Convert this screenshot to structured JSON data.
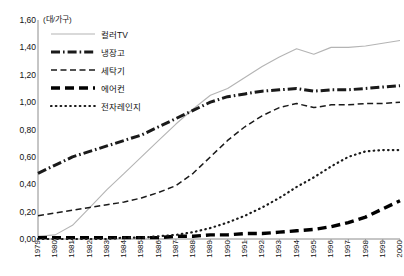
{
  "chart_data": {
    "type": "line",
    "title": "",
    "subtitle": "",
    "xlabel": "",
    "ylabel": "(대/가구)",
    "unit_caption": "(대/가구)",
    "grid": false,
    "legend_position": "top-left-inside",
    "ylim": [
      0.0,
      1.6
    ],
    "ytick_step": 0.2,
    "decimal_separator": ",",
    "ytick_labels": [
      "1,60",
      "1,40",
      "1,20",
      "1,00",
      "0,80",
      "0,60",
      "0,40",
      "0,20",
      "0,00"
    ],
    "ytick_values": [
      1.6,
      1.4,
      1.2,
      1.0,
      0.8,
      0.6,
      0.4,
      0.2,
      0.0
    ],
    "categories": [
      "1979",
      "1980",
      "1981",
      "1982",
      "1983",
      "1984",
      "1985",
      "1986",
      "1987",
      "1988",
      "1989",
      "1990",
      "1991",
      "1992",
      "1993",
      "1994",
      "1995",
      "1996",
      "1997",
      "1998",
      "1999",
      "2000"
    ],
    "x": [
      1979,
      1980,
      1981,
      1982,
      1983,
      1984,
      1985,
      1986,
      1987,
      1988,
      1989,
      1990,
      1991,
      1992,
      1993,
      1994,
      1995,
      1996,
      1997,
      1998,
      1999,
      2000
    ],
    "series": [
      {
        "name": "컬러TV",
        "style": "solid-thin",
        "color": "#b4b4b4",
        "values": [
          0.02,
          0.03,
          0.1,
          0.23,
          0.36,
          0.48,
          0.6,
          0.72,
          0.84,
          0.95,
          1.05,
          1.1,
          1.18,
          1.26,
          1.33,
          1.39,
          1.35,
          1.4,
          1.4,
          1.41,
          1.43,
          1.45
        ]
      },
      {
        "name": "냉장고",
        "style": "dash-dot-thick",
        "color": "#1a1a1a",
        "values": [
          0.48,
          0.54,
          0.6,
          0.64,
          0.68,
          0.72,
          0.76,
          0.82,
          0.88,
          0.94,
          1.0,
          1.04,
          1.06,
          1.08,
          1.09,
          1.1,
          1.08,
          1.09,
          1.09,
          1.1,
          1.11,
          1.12
        ]
      },
      {
        "name": "세탁기",
        "style": "dash-thin",
        "color": "#1a1a1a",
        "values": [
          0.17,
          0.19,
          0.21,
          0.23,
          0.25,
          0.27,
          0.3,
          0.34,
          0.39,
          0.48,
          0.6,
          0.72,
          0.82,
          0.9,
          0.96,
          0.99,
          0.96,
          0.98,
          0.98,
          0.99,
          0.99,
          1.0
        ]
      },
      {
        "name": "에어컨",
        "style": "dash-thick",
        "color": "#000000",
        "values": [
          0.01,
          0.01,
          0.01,
          0.01,
          0.01,
          0.01,
          0.01,
          0.01,
          0.02,
          0.02,
          0.03,
          0.03,
          0.04,
          0.04,
          0.05,
          0.06,
          0.07,
          0.09,
          0.12,
          0.16,
          0.22,
          0.28
        ]
      },
      {
        "name": "전자레인지",
        "style": "dotted",
        "color": "#1a1a1a",
        "values": [
          0.0,
          0.0,
          0.0,
          0.0,
          0.0,
          0.01,
          0.01,
          0.02,
          0.03,
          0.05,
          0.08,
          0.12,
          0.17,
          0.23,
          0.3,
          0.38,
          0.45,
          0.53,
          0.6,
          0.64,
          0.65,
          0.65
        ]
      }
    ]
  },
  "legend": {
    "items": [
      {
        "label": "컬러TV",
        "style": "solid-thin",
        "color": "#b4b4b4"
      },
      {
        "label": "냉장고",
        "style": "dash-dot-thick",
        "color": "#1a1a1a"
      },
      {
        "label": "세탁기",
        "style": "dash-thin",
        "color": "#1a1a1a"
      },
      {
        "label": "에어컨",
        "style": "dash-thick",
        "color": "#000000"
      },
      {
        "label": "전자레인지",
        "style": "dotted",
        "color": "#1a1a1a"
      }
    ]
  },
  "axes": {
    "axis_color": "#8c8c8c"
  }
}
